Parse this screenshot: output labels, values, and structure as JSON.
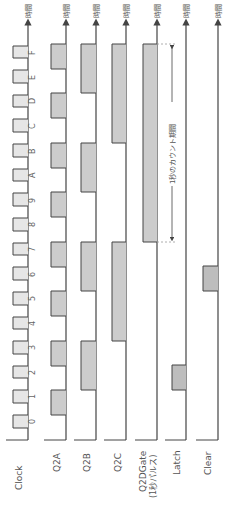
{
  "diagram": {
    "orientation": "rotated 90° — time flows upward",
    "time_axis_label": "時間",
    "annotation": "1秒のカウント期間",
    "colors": {
      "line": "#444444",
      "pulse_fill_clock": "#e6e6e6",
      "pulse_fill": "#cccccc",
      "pulse_fill_dark": "#bdbdbd",
      "dashed": "#999999"
    },
    "clock_ticks": [
      "0",
      "1",
      "2",
      "3",
      "4",
      "5",
      "6",
      "7",
      "8",
      "9",
      "A",
      "B",
      "C",
      "D",
      "E",
      "F"
    ],
    "channels": [
      {
        "name": "Clock",
        "label": "Clock"
      },
      {
        "name": "Q2A",
        "label": "Q2A"
      },
      {
        "name": "Q2B",
        "label": "Q2B"
      },
      {
        "name": "Q2C",
        "label": "Q2C"
      },
      {
        "name": "Q2DGate",
        "label": "Q2DGate",
        "sublabel": "(1秒パルス)"
      },
      {
        "name": "Latch",
        "label": "Latch"
      },
      {
        "name": "Clear",
        "label": "Clear"
      }
    ]
  }
}
